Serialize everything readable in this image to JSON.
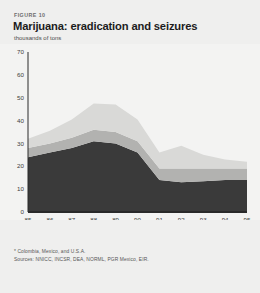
{
  "figure": {
    "label": "FIGURE 10",
    "title": "Marijuana: eradication and seizures",
    "subtitle": "thousands of tons"
  },
  "notes": {
    "footnote": "* Colombia, Mexico, and U.S.A.",
    "source": "Sources: NNICC, INCSR, DEA, NORML, PGR Mexico, EIR."
  },
  "legend": [
    {
      "label": "Eradication*",
      "color": "#d9d9d7"
    },
    {
      "label": "Seizures",
      "color": "#b2b2b0"
    },
    {
      "label": "Net available",
      "color": "#3a3a3a"
    }
  ],
  "colors": {
    "background": "#efefee",
    "plot_background": "#f3f3f2",
    "eradication": "#d9d9d7",
    "seizures": "#b2b2b0",
    "net_available": "#3a3a3a",
    "axis": "#2a2a2a",
    "text": "#1c1c1c"
  },
  "annotations": [
    {
      "text": "Gross cultivation",
      "x": 1992.6,
      "y": 30
    }
  ],
  "chart_data": {
    "type": "area",
    "title": "Marijuana: eradication and seizures",
    "subtitle": "thousands of tons",
    "xlabel": "",
    "ylabel": "thousands of tons",
    "stacked": true,
    "grid": false,
    "legend_position": "bottom",
    "categories": [
      "85",
      "86",
      "87",
      "88",
      "89",
      "90",
      "91",
      "92",
      "93",
      "94",
      "95"
    ],
    "x": [
      1985,
      1986,
      1987,
      1988,
      1989,
      1990,
      1991,
      1992,
      1993,
      1994,
      1995
    ],
    "xlim": [
      1985,
      1995
    ],
    "ylim": [
      0,
      70
    ],
    "yticks": [
      0,
      10,
      20,
      30,
      40,
      50,
      60,
      70
    ],
    "series": [
      {
        "name": "Net available",
        "color": "#3a3a3a",
        "values": [
          24,
          26,
          28,
          31,
          30,
          26,
          14,
          13,
          13.5,
          14,
          14
        ]
      },
      {
        "name": "Seizures",
        "color": "#b2b2b0",
        "values": [
          4,
          4,
          4.5,
          5,
          5,
          5,
          5,
          6,
          5.5,
          5,
          5
        ]
      },
      {
        "name": "Eradication*",
        "color": "#d9d9d7",
        "values": [
          4,
          5.5,
          8,
          11.5,
          12,
          9.5,
          7,
          10,
          6,
          4,
          3
        ]
      }
    ],
    "totals": [
      32,
      35.5,
      40.5,
      47.5,
      47,
      40.5,
      26,
      29,
      25,
      23,
      22
    ]
  }
}
